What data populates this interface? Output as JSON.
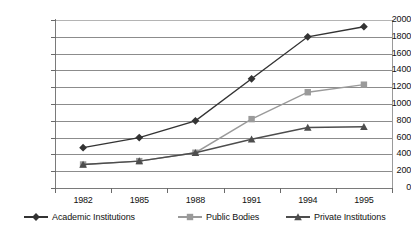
{
  "chart_data": {
    "type": "line",
    "title": "",
    "subtitle": "",
    "xlabel": "",
    "ylabel": "",
    "categories": [
      "1982",
      "1985",
      "1988",
      "1991",
      "1994",
      "1995"
    ],
    "ylim": [
      0,
      2000
    ],
    "ytick_step": 200,
    "yticks": [
      0,
      200,
      400,
      600,
      800,
      1000,
      1200,
      1400,
      1600,
      1800,
      2000
    ],
    "ytick_labels": [
      "0",
      "200",
      "400",
      "600",
      "800",
      "1000",
      "1200",
      "1400",
      "1600",
      "1800",
      "2000"
    ],
    "grid": true,
    "grid_axis": "y",
    "legend_position": "bottom",
    "series": [
      {
        "name": "Academic Institutions",
        "values": [
          480,
          600,
          800,
          1300,
          1800,
          1920
        ],
        "color": "#333333",
        "marker": "diamond"
      },
      {
        "name": "Public Bodies",
        "values": [
          280,
          320,
          420,
          820,
          1140,
          1230
        ],
        "color": "#9a9a9a",
        "marker": "square"
      },
      {
        "name": "Private Institutions",
        "values": [
          280,
          320,
          420,
          580,
          720,
          730
        ],
        "color": "#4d4d4d",
        "marker": "triangle"
      }
    ]
  },
  "legend": {
    "items": [
      {
        "label": "Academic Institutions"
      },
      {
        "label": "Public Bodies"
      },
      {
        "label": "Private Institutions"
      }
    ]
  },
  "colors": {
    "background": "#ffffff",
    "gridline": "#8c8c8c",
    "axis": "#7a7a7a",
    "text": "#111111"
  }
}
